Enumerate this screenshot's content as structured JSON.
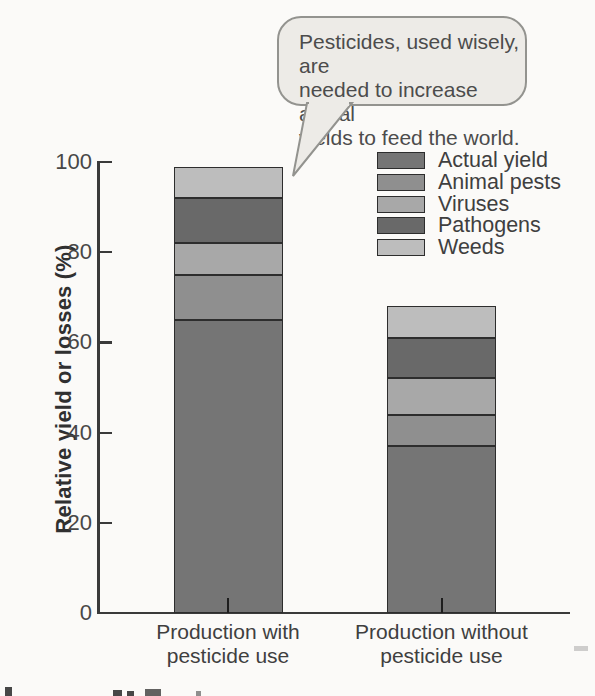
{
  "bubble": {
    "lines": [
      "Pesticides, used wisely, are",
      "needed to increase actual",
      "yields to feed the world."
    ],
    "fill": "#edebe7",
    "border": "#93938f"
  },
  "chart_data": {
    "type": "bar",
    "stacked": true,
    "title": "",
    "xlabel": "",
    "ylabel": "Relative yield or losses (%)",
    "ylim": [
      0,
      100
    ],
    "yticks": [
      0,
      20,
      40,
      60,
      80,
      100
    ],
    "grid": false,
    "legend_position": "top-right",
    "categories": [
      [
        "Production with",
        "pesticide use"
      ],
      [
        "Production without",
        "pesticide use"
      ]
    ],
    "series": [
      {
        "name": "Actual yield",
        "color": "#757575",
        "values": [
          65,
          37
        ]
      },
      {
        "name": "Animal pests",
        "color": "#8f8f8f",
        "values": [
          10,
          7
        ]
      },
      {
        "name": "Viruses",
        "color": "#a8a8a8",
        "values": [
          7,
          8
        ]
      },
      {
        "name": "Pathogens",
        "color": "#696969",
        "values": [
          10,
          9
        ]
      },
      {
        "name": "Weeds",
        "color": "#bdbdbd",
        "values": [
          7,
          7
        ]
      }
    ],
    "stack_totals": [
      99,
      68
    ],
    "annotation": "Pesticides, used wisely, are needed to increase actual yields to feed the world."
  }
}
